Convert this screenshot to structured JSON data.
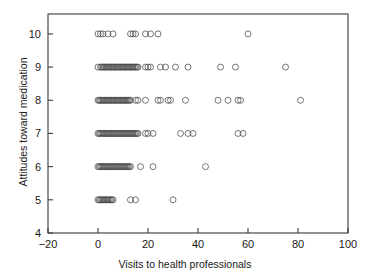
{
  "chart_data": {
    "type": "scatter",
    "title": "",
    "subtitle": "",
    "xlabel": "Visits to health professionals",
    "ylabel": "Attitudes toward medication",
    "xlim": [
      -20,
      100
    ],
    "ylim": [
      4,
      10.6
    ],
    "xticks": [
      -20,
      0,
      20,
      40,
      60,
      80,
      100
    ],
    "xticklabels": [
      "−20",
      "0",
      "20",
      "40",
      "60",
      "80",
      "100"
    ],
    "yticks": [
      4,
      5,
      6,
      7,
      8,
      9,
      10
    ],
    "yticklabels": [
      "4",
      "5",
      "6",
      "7",
      "8",
      "9",
      "10"
    ],
    "grid": false,
    "legend": null,
    "marker": "open-circle",
    "marker_size": 3.0,
    "marker_color": "#4a4a4a",
    "frame": "box",
    "points": [
      {
        "x": 0,
        "y": 10
      },
      {
        "x": 1,
        "y": 10
      },
      {
        "x": 2,
        "y": 10
      },
      {
        "x": 4,
        "y": 10
      },
      {
        "x": 6,
        "y": 10
      },
      {
        "x": 13,
        "y": 10
      },
      {
        "x": 14,
        "y": 10
      },
      {
        "x": 15,
        "y": 10
      },
      {
        "x": 19,
        "y": 10
      },
      {
        "x": 21,
        "y": 10
      },
      {
        "x": 24,
        "y": 10
      },
      {
        "x": 60,
        "y": 10
      },
      {
        "x": 0,
        "y": 9
      },
      {
        "x": 1,
        "y": 9
      },
      {
        "x": 1.5,
        "y": 9
      },
      {
        "x": 2,
        "y": 9
      },
      {
        "x": 2.5,
        "y": 9
      },
      {
        "x": 3,
        "y": 9
      },
      {
        "x": 3.5,
        "y": 9
      },
      {
        "x": 4,
        "y": 9
      },
      {
        "x": 4.5,
        "y": 9
      },
      {
        "x": 5,
        "y": 9
      },
      {
        "x": 5.5,
        "y": 9
      },
      {
        "x": 6,
        "y": 9
      },
      {
        "x": 6.5,
        "y": 9
      },
      {
        "x": 7,
        "y": 9
      },
      {
        "x": 7.5,
        "y": 9
      },
      {
        "x": 8,
        "y": 9
      },
      {
        "x": 8.5,
        "y": 9
      },
      {
        "x": 9,
        "y": 9
      },
      {
        "x": 9.5,
        "y": 9
      },
      {
        "x": 10,
        "y": 9
      },
      {
        "x": 10.5,
        "y": 9
      },
      {
        "x": 11,
        "y": 9
      },
      {
        "x": 11.5,
        "y": 9
      },
      {
        "x": 12,
        "y": 9
      },
      {
        "x": 12.5,
        "y": 9
      },
      {
        "x": 13,
        "y": 9
      },
      {
        "x": 13.5,
        "y": 9
      },
      {
        "x": 14,
        "y": 9
      },
      {
        "x": 14.5,
        "y": 9
      },
      {
        "x": 15,
        "y": 9
      },
      {
        "x": 15.5,
        "y": 9
      },
      {
        "x": 16,
        "y": 9
      },
      {
        "x": 19,
        "y": 9
      },
      {
        "x": 20,
        "y": 9
      },
      {
        "x": 21,
        "y": 9
      },
      {
        "x": 25,
        "y": 9
      },
      {
        "x": 27,
        "y": 9
      },
      {
        "x": 31,
        "y": 9
      },
      {
        "x": 36,
        "y": 9
      },
      {
        "x": 49,
        "y": 9
      },
      {
        "x": 55,
        "y": 9
      },
      {
        "x": 75,
        "y": 9
      },
      {
        "x": 0,
        "y": 8
      },
      {
        "x": 0.5,
        "y": 8
      },
      {
        "x": 1,
        "y": 8
      },
      {
        "x": 1.5,
        "y": 8
      },
      {
        "x": 2,
        "y": 8
      },
      {
        "x": 2.5,
        "y": 8
      },
      {
        "x": 3,
        "y": 8
      },
      {
        "x": 3.5,
        "y": 8
      },
      {
        "x": 4,
        "y": 8
      },
      {
        "x": 4.5,
        "y": 8
      },
      {
        "x": 5,
        "y": 8
      },
      {
        "x": 5.5,
        "y": 8
      },
      {
        "x": 6,
        "y": 8
      },
      {
        "x": 6.5,
        "y": 8
      },
      {
        "x": 7,
        "y": 8
      },
      {
        "x": 7.5,
        "y": 8
      },
      {
        "x": 8,
        "y": 8
      },
      {
        "x": 8.5,
        "y": 8
      },
      {
        "x": 9,
        "y": 8
      },
      {
        "x": 9.5,
        "y": 8
      },
      {
        "x": 10,
        "y": 8
      },
      {
        "x": 10.5,
        "y": 8
      },
      {
        "x": 11,
        "y": 8
      },
      {
        "x": 11.5,
        "y": 8
      },
      {
        "x": 12,
        "y": 8
      },
      {
        "x": 12.5,
        "y": 8
      },
      {
        "x": 13,
        "y": 8
      },
      {
        "x": 15,
        "y": 8
      },
      {
        "x": 16,
        "y": 8
      },
      {
        "x": 19,
        "y": 8
      },
      {
        "x": 24,
        "y": 8
      },
      {
        "x": 25,
        "y": 8
      },
      {
        "x": 28,
        "y": 8
      },
      {
        "x": 29,
        "y": 8
      },
      {
        "x": 35,
        "y": 8
      },
      {
        "x": 48,
        "y": 8
      },
      {
        "x": 52,
        "y": 8
      },
      {
        "x": 56,
        "y": 8
      },
      {
        "x": 57,
        "y": 8
      },
      {
        "x": 81,
        "y": 8
      },
      {
        "x": 0,
        "y": 7
      },
      {
        "x": 0.5,
        "y": 7
      },
      {
        "x": 1,
        "y": 7
      },
      {
        "x": 1.5,
        "y": 7
      },
      {
        "x": 2,
        "y": 7
      },
      {
        "x": 2.5,
        "y": 7
      },
      {
        "x": 3,
        "y": 7
      },
      {
        "x": 3.5,
        "y": 7
      },
      {
        "x": 4,
        "y": 7
      },
      {
        "x": 4.5,
        "y": 7
      },
      {
        "x": 5,
        "y": 7
      },
      {
        "x": 5.5,
        "y": 7
      },
      {
        "x": 6,
        "y": 7
      },
      {
        "x": 6.5,
        "y": 7
      },
      {
        "x": 7,
        "y": 7
      },
      {
        "x": 7.5,
        "y": 7
      },
      {
        "x": 8,
        "y": 7
      },
      {
        "x": 8.5,
        "y": 7
      },
      {
        "x": 9,
        "y": 7
      },
      {
        "x": 9.5,
        "y": 7
      },
      {
        "x": 10,
        "y": 7
      },
      {
        "x": 10.5,
        "y": 7
      },
      {
        "x": 11,
        "y": 7
      },
      {
        "x": 11.5,
        "y": 7
      },
      {
        "x": 12,
        "y": 7
      },
      {
        "x": 12.5,
        "y": 7
      },
      {
        "x": 13,
        "y": 7
      },
      {
        "x": 13.5,
        "y": 7
      },
      {
        "x": 14,
        "y": 7
      },
      {
        "x": 14.5,
        "y": 7
      },
      {
        "x": 15,
        "y": 7
      },
      {
        "x": 15.5,
        "y": 7
      },
      {
        "x": 16,
        "y": 7
      },
      {
        "x": 19,
        "y": 7
      },
      {
        "x": 20,
        "y": 7
      },
      {
        "x": 22,
        "y": 7
      },
      {
        "x": 33,
        "y": 7
      },
      {
        "x": 36,
        "y": 7
      },
      {
        "x": 38,
        "y": 7
      },
      {
        "x": 56,
        "y": 7
      },
      {
        "x": 58,
        "y": 7
      },
      {
        "x": 0,
        "y": 6
      },
      {
        "x": 0.5,
        "y": 6
      },
      {
        "x": 1,
        "y": 6
      },
      {
        "x": 1.5,
        "y": 6
      },
      {
        "x": 2,
        "y": 6
      },
      {
        "x": 2.5,
        "y": 6
      },
      {
        "x": 3,
        "y": 6
      },
      {
        "x": 3.5,
        "y": 6
      },
      {
        "x": 4,
        "y": 6
      },
      {
        "x": 4.5,
        "y": 6
      },
      {
        "x": 5,
        "y": 6
      },
      {
        "x": 5.5,
        "y": 6
      },
      {
        "x": 6,
        "y": 6
      },
      {
        "x": 6.5,
        "y": 6
      },
      {
        "x": 7,
        "y": 6
      },
      {
        "x": 7.5,
        "y": 6
      },
      {
        "x": 8,
        "y": 6
      },
      {
        "x": 8.5,
        "y": 6
      },
      {
        "x": 9,
        "y": 6
      },
      {
        "x": 9.5,
        "y": 6
      },
      {
        "x": 10,
        "y": 6
      },
      {
        "x": 10.5,
        "y": 6
      },
      {
        "x": 11,
        "y": 6
      },
      {
        "x": 11.5,
        "y": 6
      },
      {
        "x": 12,
        "y": 6
      },
      {
        "x": 12.5,
        "y": 6
      },
      {
        "x": 13,
        "y": 6
      },
      {
        "x": 17,
        "y": 6
      },
      {
        "x": 22,
        "y": 6
      },
      {
        "x": 43,
        "y": 6
      },
      {
        "x": 0,
        "y": 5
      },
      {
        "x": 0.5,
        "y": 5
      },
      {
        "x": 1,
        "y": 5
      },
      {
        "x": 1.5,
        "y": 5
      },
      {
        "x": 2,
        "y": 5
      },
      {
        "x": 2.5,
        "y": 5
      },
      {
        "x": 3,
        "y": 5
      },
      {
        "x": 3.5,
        "y": 5
      },
      {
        "x": 4,
        "y": 5
      },
      {
        "x": 4.5,
        "y": 5
      },
      {
        "x": 5,
        "y": 5
      },
      {
        "x": 5.5,
        "y": 5
      },
      {
        "x": 6,
        "y": 5
      },
      {
        "x": 13,
        "y": 5
      },
      {
        "x": 15,
        "y": 5
      },
      {
        "x": 30,
        "y": 5
      }
    ]
  }
}
